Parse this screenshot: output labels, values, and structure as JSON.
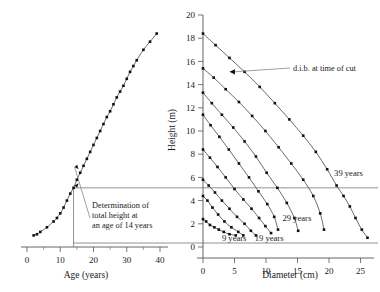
{
  "figure": {
    "background": "#ffffff",
    "curve_color": "#444444",
    "marker_color": "#111111",
    "axis_color": "#555555",
    "construction_color": "#777777"
  },
  "chart_data": [
    {
      "type": "line",
      "panel": "left",
      "title": "",
      "xlabel": "Age (years)",
      "ylabel": "",
      "xlim": [
        0,
        40
      ],
      "ylim": [
        0,
        20
      ],
      "xticks": [
        0,
        10,
        20,
        30,
        40
      ],
      "xticklabels": [
        "0",
        "10",
        "20",
        "30",
        "40"
      ],
      "xminorticks": [
        5,
        15,
        25,
        35
      ],
      "grid": false,
      "legend_position": "none",
      "series": [
        {
          "name": "height over age",
          "x": [
            2,
            3,
            4,
            6,
            8,
            9,
            10,
            11,
            12,
            13,
            14,
            15,
            16,
            17,
            18,
            19,
            20,
            21,
            22,
            23,
            24,
            25,
            26,
            27,
            28,
            29,
            30,
            31,
            32,
            33,
            35,
            37,
            39
          ],
          "y": [
            1.0,
            1.1,
            1.3,
            1.7,
            2.2,
            2.5,
            2.9,
            3.4,
            4.0,
            4.6,
            5.1,
            5.8,
            6.4,
            7.0,
            7.6,
            8.2,
            8.8,
            9.4,
            10.0,
            10.6,
            11.2,
            11.7,
            12.3,
            12.9,
            13.4,
            13.9,
            14.5,
            15.1,
            15.6,
            16.1,
            17.0,
            17.7,
            18.4
          ]
        }
      ],
      "annotations": [
        {
          "name": "determination-note",
          "lines": [
            "Determination of",
            "total height at",
            "an age of 14 years"
          ],
          "at_age": 14,
          "at_height": 5.1
        }
      ],
      "construction": {
        "vertical_at_x": 14,
        "horizontal_at_y": 5.1,
        "description": "vertical line at age 14 meets curve, horizontal transfer line at 5.1 m"
      }
    },
    {
      "type": "line",
      "panel": "right",
      "title": "",
      "xlabel": "Diameter (cm)",
      "ylabel": "Height (m)",
      "xlim": [
        0,
        26.5
      ],
      "ylim": [
        0,
        20
      ],
      "xticks": [
        0,
        5,
        10,
        15,
        20,
        25
      ],
      "xticklabels": [
        "0",
        "5",
        "10",
        "15",
        "20",
        "25"
      ],
      "yticks": [
        0,
        2,
        4,
        6,
        8,
        10,
        12,
        14,
        16,
        18,
        20
      ],
      "yticklabels": [
        "0",
        "2",
        "4",
        "6",
        "8",
        "10",
        "12",
        "14",
        "16",
        "18",
        "20"
      ],
      "grid": false,
      "legend_position": "inline",
      "series": [
        {
          "name": "9 years",
          "label": "9 years",
          "label_x": 3.0,
          "label_y": 0.75,
          "x": [
            0.0,
            0.5,
            1.1,
            1.8,
            2.5,
            3.3,
            4.2,
            5.2
          ],
          "y": [
            2.4,
            2.2,
            1.9,
            1.7,
            1.5,
            1.3,
            1.1,
            1.0
          ]
        },
        {
          "name": "pole stage A",
          "label": "",
          "x": [
            0.0,
            0.7,
            1.5,
            2.4,
            3.4,
            4.5,
            5.6,
            6.4
          ],
          "y": [
            4.4,
            4.0,
            3.4,
            2.8,
            2.2,
            1.7,
            1.3,
            1.0
          ]
        },
        {
          "name": "pole stage B",
          "label": "",
          "x": [
            0.0,
            0.9,
            1.9,
            3.0,
            4.2,
            5.4,
            6.6,
            7.6,
            8.4
          ],
          "y": [
            5.8,
            5.3,
            4.7,
            4.0,
            3.3,
            2.6,
            2.0,
            1.4,
            1.0
          ]
        },
        {
          "name": "pole stage C",
          "label": "",
          "x": [
            0.0,
            1.1,
            2.3,
            3.6,
            5.0,
            6.4,
            7.7,
            8.9,
            9.9,
            10.8
          ],
          "y": [
            8.4,
            7.7,
            6.9,
            6.0,
            5.0,
            4.1,
            3.3,
            2.5,
            1.8,
            1.2
          ]
        },
        {
          "name": "19 years",
          "label": "19 years",
          "label_x": 8.2,
          "label_y": 0.75,
          "x": [
            0.0,
            1.2,
            2.6,
            4.1,
            5.7,
            7.3,
            8.8,
            10.2,
            11.3,
            11.9
          ],
          "y": [
            11.4,
            10.5,
            9.5,
            8.4,
            7.2,
            6.0,
            4.8,
            3.7,
            2.6,
            1.5
          ]
        },
        {
          "name": "29 years",
          "label": "29 years",
          "label_x": 12.6,
          "label_y": 2.5,
          "x": [
            0.0,
            1.4,
            3.0,
            4.8,
            6.6,
            8.4,
            10.1,
            11.8,
            13.3,
            14.5,
            15.1
          ],
          "y": [
            13.3,
            12.4,
            11.4,
            10.3,
            9.1,
            7.8,
            6.4,
            5.1,
            3.8,
            2.5,
            1.4
          ]
        },
        {
          "name": "taper D",
          "label": "",
          "x": [
            0.0,
            1.7,
            3.6,
            5.7,
            7.8,
            9.9,
            12.0,
            14.0,
            15.9,
            17.5,
            18.6,
            19.2
          ],
          "y": [
            15.4,
            14.6,
            13.6,
            12.5,
            11.3,
            10.0,
            8.6,
            7.2,
            5.8,
            4.4,
            2.9,
            1.5
          ]
        },
        {
          "name": "39 years",
          "label": "39 years",
          "label_x": 20.8,
          "label_y": 6.4,
          "x": [
            0.0,
            2.0,
            4.2,
            6.6,
            9.0,
            11.4,
            13.7,
            15.9,
            17.9,
            19.7,
            21.2,
            22.3,
            23.3,
            24.2,
            25.2,
            26.1
          ],
          "y": [
            18.4,
            17.4,
            16.3,
            15.1,
            13.8,
            12.4,
            11.0,
            9.6,
            8.2,
            6.7,
            5.3,
            4.4,
            3.5,
            2.5,
            1.5,
            0.8
          ]
        }
      ],
      "annotations": [
        {
          "name": "dib-note",
          "text": "d.i.b. at time of cut",
          "points_to_x": 4.2,
          "points_to_y": 15.1
        }
      ]
    }
  ],
  "labels": {
    "left_xaxis": "Age (years)",
    "right_xaxis": "Diameter (cm)",
    "right_yaxis": "Height (m)",
    "determination_line1": "Determination of",
    "determination_line2": "total height at",
    "determination_line3": "an age of 14 years",
    "dib_note": "d.i.b. at time of cut",
    "series_9": "9 years",
    "series_19": "19 years",
    "series_29": "29 years",
    "series_39": "39 years"
  }
}
